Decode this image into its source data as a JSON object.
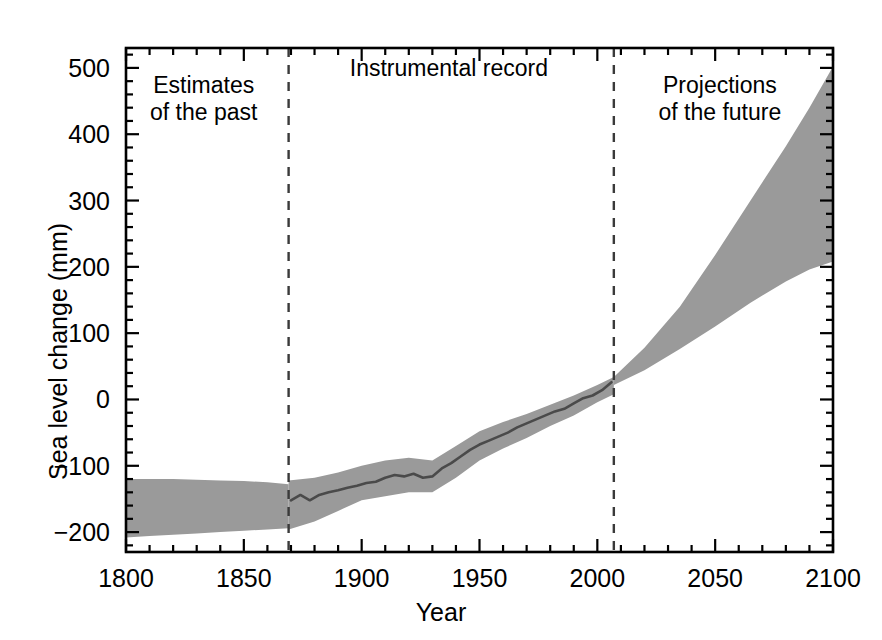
{
  "chart_data": {
    "type": "area",
    "title": "",
    "xlabel": "Year",
    "ylabel": "Sea level change (mm)",
    "xlim": [
      1800,
      2100
    ],
    "ylim": [
      -230,
      530
    ],
    "xticks": [
      1800,
      1850,
      1900,
      1950,
      2000,
      2050,
      2100
    ],
    "xtick_labels": [
      "1800",
      "1850",
      "1900",
      "1950",
      "2000",
      "2050",
      "2100"
    ],
    "yticks": [
      -200,
      -100,
      0,
      100,
      200,
      300,
      400,
      500
    ],
    "ytick_labels": [
      "−200",
      "−100",
      "0",
      "100",
      "200",
      "300",
      "400",
      "500"
    ],
    "minor_tick_interval_x": 10,
    "minor_tick_interval_y": 20,
    "grid": false,
    "legend": null,
    "band_color": "#9a9a9a",
    "line_color": "#4a4a4a",
    "axis_color": "#000000",
    "annotations": [
      {
        "name": "estimates-of-the-past",
        "text": "Estimates\nof the past",
        "x": 1833,
        "y": 470
      },
      {
        "name": "instrumental-record",
        "text": "Instrumental record",
        "x": 1937,
        "y": 495
      },
      {
        "name": "projections-of-the-future",
        "text": "Projections\nof the future",
        "x": 2052,
        "y": 470
      }
    ],
    "divider_lines": [
      {
        "name": "past-to-instrumental-divider",
        "x": 1869,
        "style": "dashed"
      },
      {
        "name": "instrumental-to-projection-divider",
        "x": 2007,
        "style": "dashed"
      }
    ],
    "series": [
      {
        "name": "Estimates of the past (uncertainty band)",
        "type": "band",
        "x": [
          1800,
          1810,
          1820,
          1830,
          1840,
          1850,
          1860,
          1869
        ],
        "upper": [
          -120,
          -120,
          -120,
          -121,
          -122,
          -123,
          -125,
          -128
        ],
        "lower": [
          -208,
          -206,
          -204,
          -202,
          -200,
          -198,
          -196,
          -194
        ]
      },
      {
        "name": "Instrumental record (uncertainty band)",
        "type": "band",
        "x": [
          1869,
          1880,
          1890,
          1900,
          1910,
          1920,
          1930,
          1940,
          1950,
          1960,
          1970,
          1980,
          1990,
          2000,
          2007
        ],
        "upper": [
          -122,
          -118,
          -110,
          -100,
          -92,
          -88,
          -92,
          -70,
          -48,
          -34,
          -22,
          -8,
          6,
          22,
          34
        ],
        "lower": [
          -196,
          -184,
          -168,
          -152,
          -146,
          -140,
          -140,
          -118,
          -92,
          -74,
          -58,
          -40,
          -24,
          -4,
          8
        ]
      },
      {
        "name": "Instrumental record (central estimate)",
        "type": "line",
        "x": [
          1870,
          1874,
          1878,
          1882,
          1886,
          1890,
          1894,
          1898,
          1902,
          1906,
          1910,
          1914,
          1918,
          1922,
          1926,
          1930,
          1934,
          1938,
          1942,
          1946,
          1950,
          1954,
          1958,
          1962,
          1966,
          1970,
          1974,
          1978,
          1982,
          1986,
          1990,
          1994,
          1998,
          2002,
          2006
        ],
        "y": [
          -152,
          -144,
          -152,
          -144,
          -140,
          -137,
          -133,
          -130,
          -126,
          -124,
          -118,
          -114,
          -116,
          -112,
          -118,
          -116,
          -104,
          -96,
          -86,
          -76,
          -68,
          -62,
          -56,
          -50,
          -42,
          -36,
          -30,
          -24,
          -18,
          -14,
          -6,
          2,
          6,
          14,
          26
        ]
      },
      {
        "name": "Projections of the future (range)",
        "type": "band",
        "x": [
          2007,
          2020,
          2035,
          2050,
          2065,
          2080,
          2090,
          2100
        ],
        "upper": [
          34,
          78,
          140,
          218,
          300,
          382,
          440,
          502
        ],
        "lower": [
          22,
          44,
          76,
          110,
          146,
          178,
          196,
          208
        ]
      }
    ]
  },
  "axes": {
    "ylabel_text": "Sea level change (mm)",
    "xlabel_text": "Year"
  }
}
